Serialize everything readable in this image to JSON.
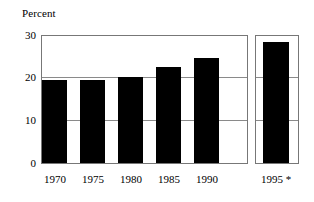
{
  "chart_data": {
    "type": "bar",
    "title": "",
    "subtitle": "",
    "xlabel": "",
    "ylabel": "Percent",
    "categories": [
      "1970",
      "1975",
      "1980",
      "1985",
      "1990",
      "1995 *"
    ],
    "values": [
      19.6,
      19.7,
      20.3,
      22.7,
      24.8,
      28.6
    ],
    "ylim": [
      0,
      30
    ],
    "yticks": [
      0,
      10,
      20,
      30
    ],
    "ytick_labels": [
      "0",
      "10",
      "20",
      "30"
    ],
    "grid": true,
    "grid_axis": "y",
    "legend": "none",
    "annotations": [
      "* projected (asterisk on 1995 label)"
    ],
    "panels": [
      {
        "name": "historical",
        "categories": [
          "1970",
          "1975",
          "1980",
          "1985",
          "1990"
        ],
        "values": [
          19.6,
          19.7,
          20.3,
          22.7,
          24.8
        ]
      },
      {
        "name": "projected",
        "categories": [
          "1995 *"
        ],
        "values": [
          28.6
        ]
      }
    ],
    "colors": {
      "bar": "#000000",
      "frame": "#777777",
      "gridline": "#8a8a8a",
      "background": "#ffffff",
      "text": "#000000"
    }
  },
  "chart": {
    "axis_title": "Percent",
    "y_ticks": {
      "t30": "30",
      "t20": "20",
      "t10": "10",
      "t0": "0"
    },
    "x_ticks": {
      "x1970": "1970",
      "x1975": "1975",
      "x1980": "1980",
      "x1985": "1985",
      "x1990": "1990",
      "x1995": "1995 *"
    }
  }
}
